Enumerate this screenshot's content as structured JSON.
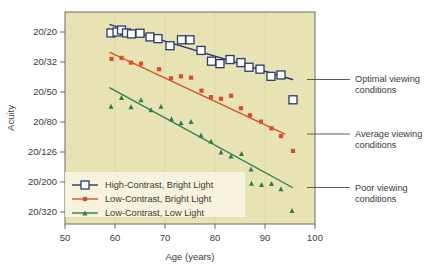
{
  "chart_data": {
    "type": "scatter",
    "title": "",
    "subtitle": "",
    "xlabel": "Age (years)",
    "ylabel": "Acuity",
    "xlim": [
      50,
      100
    ],
    "ylim_index": [
      0,
      6
    ],
    "grid": true,
    "grid_orientation": "vertical",
    "legend_position": "lower-left-inside",
    "x_ticks": [
      "50",
      "60",
      "70",
      "80",
      "90",
      "100"
    ],
    "x_tick_values": [
      50,
      60,
      70,
      80,
      90,
      100
    ],
    "y_ticks": [
      "20/20",
      "20/32",
      "20/50",
      "20/80",
      "20/126",
      "20/200",
      "20/320"
    ],
    "y_tick_values": [
      20,
      32,
      50,
      80,
      126,
      200,
      320
    ],
    "series": [
      {
        "name": "High-Contrast, Bright Light",
        "color": "#2d3a6b",
        "marker": "square-open",
        "marker_fill": "#ffffff",
        "annotation": "Optimal viewing conditions",
        "trendline": {
          "x0": 59.0,
          "y0": 17.8,
          "x1": 95.5,
          "y1": 41.5
        },
        "points": [
          {
            "x": 59.2,
            "y": 20.3
          },
          {
            "x": 60.4,
            "y": 20.0
          },
          {
            "x": 61.3,
            "y": 19.4
          },
          {
            "x": 62.3,
            "y": 20.3
          },
          {
            "x": 63.3,
            "y": 20.6
          },
          {
            "x": 65.0,
            "y": 20.4
          },
          {
            "x": 67.0,
            "y": 21.6
          },
          {
            "x": 68.6,
            "y": 22.2
          },
          {
            "x": 71.0,
            "y": 24.8
          },
          {
            "x": 73.3,
            "y": 22.6
          },
          {
            "x": 75.0,
            "y": 22.6
          },
          {
            "x": 77.2,
            "y": 26.7
          },
          {
            "x": 79.3,
            "y": 31.6
          },
          {
            "x": 81.0,
            "y": 32.8
          },
          {
            "x": 83.0,
            "y": 30.8
          },
          {
            "x": 85.2,
            "y": 32.3
          },
          {
            "x": 86.8,
            "y": 34.6
          },
          {
            "x": 89.0,
            "y": 35.6
          },
          {
            "x": 91.2,
            "y": 39.6
          },
          {
            "x": 93.2,
            "y": 38.8
          },
          {
            "x": 95.6,
            "y": 56.5
          }
        ]
      },
      {
        "name": "Low-Contrast, Bright Light",
        "color": "#d4522a",
        "marker": "square-filled",
        "marker_fill": "#d4522a",
        "annotation": "Average viewing conditions",
        "trendline": {
          "x0": 59.0,
          "y0": 27.5,
          "x1": 94.0,
          "y1": 96.0
        },
        "points": [
          {
            "x": 59.3,
            "y": 30.5
          },
          {
            "x": 61.3,
            "y": 30.0
          },
          {
            "x": 63.2,
            "y": 32.3
          },
          {
            "x": 65.2,
            "y": 32.8
          },
          {
            "x": 68.8,
            "y": 35.6
          },
          {
            "x": 71.2,
            "y": 40.8
          },
          {
            "x": 73.2,
            "y": 39.6
          },
          {
            "x": 75.2,
            "y": 40.4
          },
          {
            "x": 77.3,
            "y": 49.0
          },
          {
            "x": 79.2,
            "y": 54.2
          },
          {
            "x": 81.2,
            "y": 55.6
          },
          {
            "x": 83.2,
            "y": 53.0
          },
          {
            "x": 85.2,
            "y": 64.5
          },
          {
            "x": 87.0,
            "y": 72.0
          },
          {
            "x": 89.2,
            "y": 79.5
          },
          {
            "x": 91.3,
            "y": 88.0
          },
          {
            "x": 93.2,
            "y": 99.0
          },
          {
            "x": 95.6,
            "y": 124.0
          }
        ]
      },
      {
        "name": "Low-Contrast, Low Light",
        "color": "#2e7d52",
        "marker": "triangle-filled",
        "marker_fill": "#2e7d52",
        "annotation": "Poor viewing conditions",
        "trendline": {
          "x0": 59.0,
          "y0": 47.0,
          "x1": 95.5,
          "y1": 218.0
        },
        "points": [
          {
            "x": 59.2,
            "y": 62.5
          },
          {
            "x": 61.3,
            "y": 54.5
          },
          {
            "x": 63.2,
            "y": 63.0
          },
          {
            "x": 65.2,
            "y": 56.5
          },
          {
            "x": 67.2,
            "y": 66.0
          },
          {
            "x": 69.2,
            "y": 62.5
          },
          {
            "x": 71.3,
            "y": 76.0
          },
          {
            "x": 73.2,
            "y": 81.0
          },
          {
            "x": 75.2,
            "y": 79.5
          },
          {
            "x": 77.2,
            "y": 97.5
          },
          {
            "x": 79.2,
            "y": 107.0
          },
          {
            "x": 81.2,
            "y": 126.0
          },
          {
            "x": 83.2,
            "y": 134.0
          },
          {
            "x": 85.3,
            "y": 129.0
          },
          {
            "x": 87.2,
            "y": 164.0
          },
          {
            "x": 87.3,
            "y": 204.0
          },
          {
            "x": 89.3,
            "y": 208.0
          },
          {
            "x": 91.3,
            "y": 205.0
          },
          {
            "x": 93.2,
            "y": 222.0
          },
          {
            "x": 95.4,
            "y": 312.0
          }
        ]
      }
    ]
  },
  "axes": {
    "y_title": "Acuity",
    "x_title": "Age (years)"
  },
  "legend": {
    "items": [
      {
        "label": "High-Contrast, Bright Light",
        "color": "#2d3a6b",
        "marker": "square-open"
      },
      {
        "label": "Low-Contrast, Bright Light",
        "color": "#d4522a",
        "marker": "square-filled"
      },
      {
        "label": "Low-Contrast, Low Light",
        "color": "#2e7d52",
        "marker": "triangle-filled"
      }
    ]
  },
  "annotations": [
    {
      "name": "optimal",
      "line1": "Optimal viewing",
      "line2": "conditions"
    },
    {
      "name": "average",
      "line1": "Average viewing",
      "line2": "conditions"
    },
    {
      "name": "poor",
      "line1": "Poor viewing",
      "line2": "conditions"
    }
  ],
  "colors": {
    "plot_background": "#e8e3b4",
    "page_background": "#ffffff",
    "frame": "#6b6b5a",
    "grid": "#dcd7a4",
    "text": "#3a3a38",
    "leader_line": "#5a5a52",
    "legend_background": "#f7f3de"
  }
}
